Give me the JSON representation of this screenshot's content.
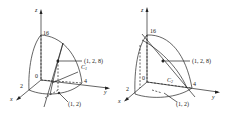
{
  "figures": [
    {
      "id": "left",
      "axes": {
        "x": "x",
        "y": "y",
        "z": "z"
      },
      "ticks": {
        "z_top": "16",
        "origin": "0",
        "x": "2",
        "y": "4"
      },
      "curve_label": "C",
      "curve_sub": "1",
      "point_3d": "(1, 2, 8)",
      "point_2d": "(1, 2)"
    },
    {
      "id": "right",
      "axes": {
        "x": "x",
        "y": "y",
        "z": "z"
      },
      "ticks": {
        "z_top": "16",
        "origin": "0",
        "x": "2",
        "y": "4"
      },
      "curve_label": "C",
      "curve_sub": "2",
      "point_3d": "(1, 2, 8)",
      "point_2d": "(1, 2)"
    }
  ],
  "colors": {
    "ink": "#222222",
    "background": "#ffffff"
  }
}
